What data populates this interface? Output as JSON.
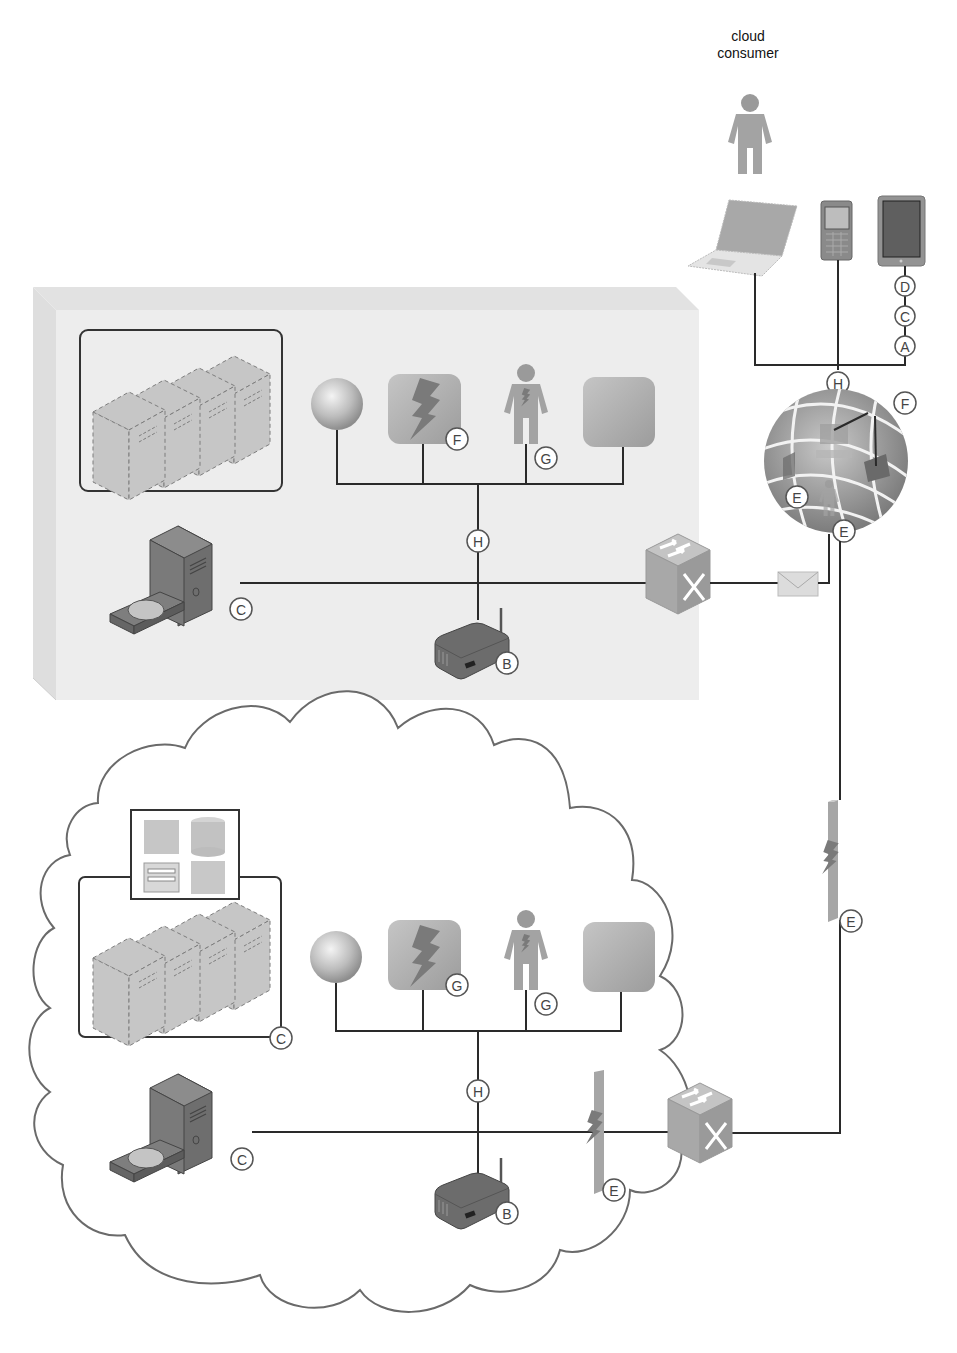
{
  "consumer": {
    "label_line1": "cloud",
    "label_line2": "consumer"
  },
  "devices": [
    "laptop",
    "mobile-phone",
    "tablet"
  ],
  "badges": {
    "tablet_d": "D",
    "tablet_c": "C",
    "tablet_a": "A",
    "consumer_h": "H",
    "internet_f": "F",
    "internet_e1": "E",
    "internet_e2": "E",
    "onprem_f": "F",
    "onprem_g": "G",
    "onprem_h": "H",
    "onprem_c": "C",
    "onprem_b": "B",
    "link_e": "E",
    "cloud_c_storage": "C",
    "cloud_g1": "G",
    "cloud_g2": "G",
    "cloud_h": "H",
    "cloud_c": "C",
    "cloud_b": "B",
    "cloud_e": "E"
  },
  "colors": {
    "onprem_bg": "#ececec",
    "device_dark": "#7b7b7b",
    "device_mid": "#a9a9a9",
    "device_light": "#c8c8c8",
    "line": "#2a2a2a"
  }
}
